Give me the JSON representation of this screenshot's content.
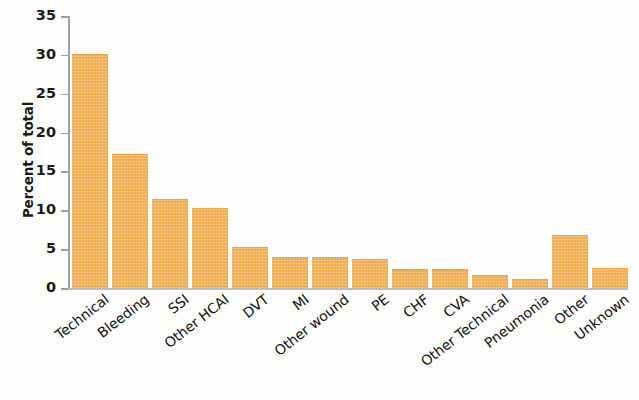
{
  "chart_data": {
    "type": "bar",
    "title": "",
    "subtitle": "",
    "xlabel": "",
    "ylabel": "Percent of total",
    "ylim": [
      0,
      35
    ],
    "ytick_values": [
      0,
      5,
      10,
      15,
      20,
      25,
      30,
      35
    ],
    "ytick_labels": [
      "0",
      "5",
      "10",
      "15",
      "20",
      "25",
      "30",
      "35"
    ],
    "grid": false,
    "legend": null,
    "bar_color": "#f0ad4e",
    "axis_color": "#9aa0a6",
    "categories": [
      "Technical",
      "Bleeding",
      "SSI",
      "Other HCAI",
      "DVT",
      "MI",
      "Other wound",
      "PE",
      "CHF",
      "CVA",
      "Other Technical",
      "Pneumonia",
      "Other",
      "Unknown"
    ],
    "values": [
      30.0,
      17.1,
      11.3,
      10.2,
      5.2,
      3.9,
      3.9,
      3.6,
      2.3,
      2.3,
      1.5,
      1.0,
      6.7,
      2.4
    ],
    "series": [
      {
        "name": "Percent of total",
        "values": [
          30.0,
          17.1,
          11.3,
          10.2,
          5.2,
          3.9,
          3.9,
          3.6,
          2.3,
          2.3,
          1.5,
          1.0,
          6.7,
          2.4
        ]
      }
    ]
  }
}
